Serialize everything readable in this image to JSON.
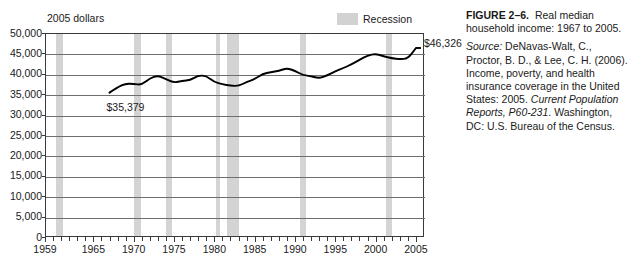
{
  "chart": {
    "axis_title": "2005 dollars",
    "legend": {
      "label": "Recession",
      "swatch_color": "#d2d2d2"
    },
    "point_labels": {
      "start": "$35,379",
      "end": "$46,326"
    }
  },
  "caption": {
    "figure_number": "FIGURE 2–6.",
    "title": "Real median household income: 1967 to 2005.",
    "source_label": "Source:",
    "source_text_1": " DeNavas-Walt, C., Proctor, B. D., & Lee, C. H. (2006). Income, poverty, and health insurance coverage in the United States: 2005. ",
    "source_italic_1": "Current Population Reports, P60-231",
    "source_text_2": ". Washington, DC: U.S. Bureau of the Census."
  },
  "chart_data": {
    "type": "line",
    "title": "Real median household income: 1967 to 2005",
    "xlabel": "",
    "ylabel": "2005 dollars",
    "xlim": [
      1959,
      2006
    ],
    "ylim": [
      0,
      50000
    ],
    "ytick_labels": [
      "0",
      "5,000",
      "10,000",
      "15,000",
      "20,000",
      "25,000",
      "30,000",
      "35,000",
      "40,000",
      "45,000",
      "50,000"
    ],
    "ytick_values": [
      0,
      5000,
      10000,
      15000,
      20000,
      25000,
      30000,
      35000,
      40000,
      45000,
      50000
    ],
    "xtick_labels": [
      "1959",
      "1965",
      "1970",
      "1975",
      "1980",
      "1985",
      "1990",
      "1995",
      "2000",
      "2005"
    ],
    "xtick_values": [
      1959,
      1965,
      1970,
      1975,
      1980,
      1985,
      1990,
      1995,
      2000,
      2005
    ],
    "grid": true,
    "legend_position": "top-right",
    "series": [
      {
        "name": "Real median household income",
        "x": [
          1967,
          1968,
          1969,
          1970,
          1971,
          1972,
          1973,
          1974,
          1975,
          1976,
          1977,
          1978,
          1979,
          1980,
          1981,
          1982,
          1983,
          1984,
          1985,
          1986,
          1987,
          1988,
          1989,
          1990,
          1991,
          1992,
          1993,
          1994,
          1995,
          1996,
          1997,
          1998,
          1999,
          2000,
          2001,
          2002,
          2003,
          2004,
          2005
        ],
        "y": [
          35379,
          36700,
          37600,
          37500,
          37300,
          38900,
          39600,
          38700,
          37800,
          38300,
          38400,
          39600,
          39500,
          38000,
          37400,
          37100,
          37000,
          38000,
          38700,
          40000,
          40400,
          40700,
          41400,
          40700,
          39700,
          39400,
          38900,
          39600,
          40600,
          41400,
          42300,
          43400,
          44500,
          44900,
          44300,
          43800,
          43600,
          43700,
          46326
        ]
      }
    ],
    "annotations": [
      {
        "text": "$35,379",
        "x": 1967,
        "y": 35379
      },
      {
        "text": "$46,326",
        "x": 2005,
        "y": 46326
      }
    ],
    "shaded_regions": {
      "label": "Recession",
      "color": "#d4d4d4",
      "spans": [
        [
          1960.2,
          1961.1
        ],
        [
          1969.9,
          1970.8
        ],
        [
          1973.9,
          1974.6
        ],
        [
          1980.1,
          1980.6
        ],
        [
          1981.5,
          1982.9
        ],
        [
          1990.5,
          1991.2
        ],
        [
          2001.2,
          2001.9
        ]
      ]
    }
  }
}
